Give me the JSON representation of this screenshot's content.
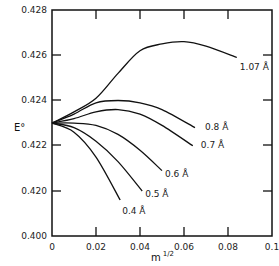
{
  "chart_data": {
    "type": "line",
    "title": "",
    "xlabel": "m 1/2",
    "ylabel": "E°",
    "xlim": [
      0,
      0.1
    ],
    "ylim_display": [
      0.4,
      0.428
    ],
    "y_axis_note": "broken axis: bottom tick 0.400, then 0.420–0.428 linear",
    "x_ticks": [
      "0",
      "0.02",
      "0.04",
      "0.06",
      "0.08",
      "0.1"
    ],
    "y_ticks": [
      "0.400",
      "0.420",
      "0.422",
      "0.424",
      "0.426",
      "0.428"
    ],
    "grid": false,
    "legend": "inline curve labels",
    "series": [
      {
        "name": "1.07 Å",
        "label": "1.07 Å",
        "x": [
          0,
          0.01,
          0.02,
          0.03,
          0.04,
          0.05,
          0.06,
          0.07,
          0.084
        ],
        "y": [
          0.423,
          0.4235,
          0.4241,
          0.4252,
          0.4262,
          0.4265,
          0.4266,
          0.4264,
          0.4259
        ]
      },
      {
        "name": "0.8 Å",
        "label": "0.8 Å",
        "x": [
          0,
          0.01,
          0.02,
          0.03,
          0.04,
          0.05,
          0.065
        ],
        "y": [
          0.423,
          0.4234,
          0.4239,
          0.424,
          0.4239,
          0.4236,
          0.4228
        ]
      },
      {
        "name": "0.7 Å",
        "label": "0.7 Å",
        "x": [
          0,
          0.01,
          0.02,
          0.03,
          0.04,
          0.05,
          0.064
        ],
        "y": [
          0.423,
          0.4232,
          0.4235,
          0.4236,
          0.4234,
          0.4229,
          0.422
        ]
      },
      {
        "name": "0.6 Å",
        "label": "0.6 Å",
        "x": [
          0,
          0.01,
          0.02,
          0.03,
          0.04,
          0.05
        ],
        "y": [
          0.423,
          0.423,
          0.4229,
          0.4225,
          0.4218,
          0.4209
        ]
      },
      {
        "name": "0.5 Å",
        "label": "0.5 Å",
        "x": [
          0,
          0.01,
          0.02,
          0.03,
          0.041
        ],
        "y": [
          0.423,
          0.4228,
          0.4222,
          0.4213,
          0.42
        ]
      },
      {
        "name": "0.4 Å",
        "label": "0.4 Å",
        "x": [
          0,
          0.01,
          0.02,
          0.031
        ],
        "y": [
          0.423,
          0.4226,
          0.4215,
          0.4196
        ]
      }
    ]
  },
  "axes": {
    "y_title": "E°",
    "x_title_base": "m",
    "x_title_exp": "1/2"
  }
}
